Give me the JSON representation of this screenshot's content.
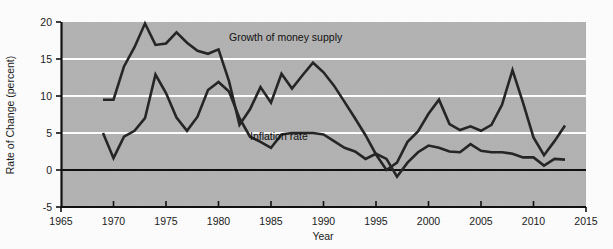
{
  "chart_data": {
    "type": "line",
    "title": "",
    "subtitle": "",
    "xlabel": "Year",
    "ylabel": "Rate of Change (percent)",
    "xlim": [
      1965,
      2015
    ],
    "ylim": [
      -5,
      20
    ],
    "xticks": [
      1965,
      1970,
      1975,
      1980,
      1985,
      1990,
      1995,
      2000,
      2005,
      2010,
      2015
    ],
    "yticks": [
      -5,
      0,
      5,
      10,
      15,
      20
    ],
    "grid": "horizontal gridlines at 5, 10, 15 (white); zero line solid black",
    "legend_position": "inline annotations on plot",
    "plot_background": "#b3b3b3",
    "gridline_color": "#ffffff",
    "line_color": "#262626",
    "series": [
      {
        "name": "Growth of money supply",
        "label_x": 1981.0,
        "label_y": 17.4,
        "x": [
          1969,
          1970,
          1971,
          1972,
          1973,
          1974,
          1975,
          1976,
          1977,
          1978,
          1979,
          1980,
          1981,
          1982,
          1983,
          1984,
          1985,
          1986,
          1987,
          1988,
          1989,
          1990,
          1991,
          1992,
          1993,
          1994,
          1995,
          1996,
          1997,
          1998,
          1999,
          2000,
          2001,
          2002,
          2003,
          2004,
          2005,
          2006,
          2007,
          2008,
          2009,
          2010,
          2011,
          2012,
          2013
        ],
        "values": [
          9.5,
          9.5,
          14.0,
          16.6,
          19.8,
          16.9,
          17.1,
          18.6,
          17.2,
          16.1,
          15.7,
          16.3,
          12.0,
          6.1,
          8.2,
          11.2,
          9.1,
          13.0,
          11.0,
          12.8,
          14.5,
          13.2,
          11.4,
          9.2,
          7.0,
          4.7,
          2.1,
          0.0,
          1.0,
          3.8,
          5.2,
          7.6,
          9.5,
          6.2,
          5.4,
          5.9,
          5.3,
          6.1,
          8.8,
          13.5,
          9.1,
          4.4,
          2.0,
          3.9,
          6.0
        ]
      },
      {
        "name": "Inflation rate",
        "label_x": 1983.0,
        "label_y": 4.0,
        "x": [
          1969,
          1970,
          1971,
          1972,
          1973,
          1974,
          1975,
          1976,
          1977,
          1978,
          1979,
          1980,
          1981,
          1982,
          1983,
          1984,
          1985,
          1986,
          1987,
          1988,
          1989,
          1990,
          1991,
          1992,
          1993,
          1994,
          1995,
          1996,
          1997,
          1998,
          1999,
          2000,
          2001,
          2002,
          2003,
          2004,
          2005,
          2006,
          2007,
          2008,
          2009,
          2010,
          2011,
          2012,
          2013
        ],
        "values": [
          5.0,
          1.6,
          4.5,
          5.3,
          7.0,
          12.9,
          10.4,
          7.1,
          5.3,
          7.2,
          10.8,
          11.9,
          10.6,
          7.0,
          4.5,
          3.8,
          3.0,
          4.8,
          5.0,
          5.0,
          5.0,
          4.8,
          3.9,
          3.0,
          2.5,
          1.5,
          2.2,
          1.5,
          -0.9,
          1.0,
          2.4,
          3.3,
          3.0,
          2.5,
          2.4,
          3.5,
          2.6,
          2.4,
          2.4,
          2.2,
          1.7,
          1.7,
          0.6,
          1.5,
          1.4
        ]
      }
    ]
  },
  "annotations": {
    "money_supply_label": "Growth of money supply",
    "inflation_label": "Inflation rate"
  }
}
